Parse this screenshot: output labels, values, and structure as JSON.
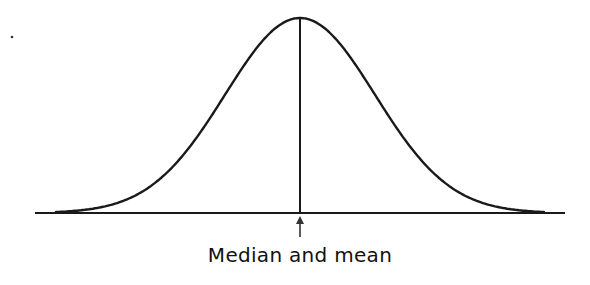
{
  "diagram": {
    "label": "Median and mean",
    "stroke_color": "#1a1a1a",
    "background": "#ffffff",
    "curve": {
      "type": "gaussian",
      "center_x": 300,
      "baseline_y": 213,
      "peak_y": 18,
      "sigma_px": 75,
      "x_start": 55,
      "x_end": 545
    },
    "baseline": {
      "x1": 35,
      "x2": 565,
      "y": 213
    },
    "center_line": {
      "x": 300,
      "y1": 18,
      "y2": 213
    },
    "arrow": {
      "x": 300,
      "y_tip": 216,
      "y_tail": 237
    },
    "stray_dot": {
      "x": 12,
      "y": 37
    }
  }
}
